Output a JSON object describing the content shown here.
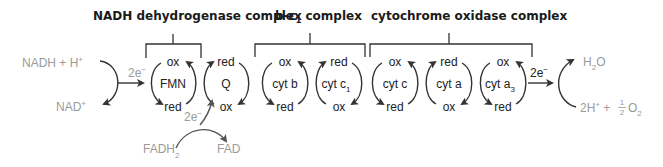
{
  "colors": {
    "primary_text": "#222222",
    "secondary_text": "#9a9a9a",
    "header_text": "#1a1a1a",
    "stroke": "#333333"
  },
  "complexes": [
    {
      "name": "NADH dehydrogenase complex",
      "main": "NADH dehydrogenase complex"
    },
    {
      "name": "b-c1 complex",
      "main": "b-c",
      "sub": "1",
      "rest": " complex"
    },
    {
      "name": "cytochrome oxidase complex",
      "main": "cytochrome oxidase complex"
    }
  ],
  "carriers": [
    {
      "name": "FMN",
      "main": "FMN",
      "sub": "",
      "top": "ox",
      "bottom": "red"
    },
    {
      "name": "Q",
      "main": "Q",
      "sub": "",
      "top": "red",
      "bottom": "ox"
    },
    {
      "name": "cyt b",
      "main": "cyt b",
      "sub": "",
      "top": "ox",
      "bottom": "red"
    },
    {
      "name": "cyt c1",
      "main": "cyt c",
      "sub": "1",
      "top": "red",
      "bottom": "ox"
    },
    {
      "name": "cyt c",
      "main": "cyt c",
      "sub": "",
      "top": "ox",
      "bottom": "red"
    },
    {
      "name": "cyt a",
      "main": "cyt a",
      "sub": "",
      "top": "red",
      "bottom": "ox"
    },
    {
      "name": "cyt a3",
      "main": "cyt a",
      "sub": "3",
      "top": "ox",
      "bottom": "red"
    }
  ],
  "inputs": {
    "nadh": {
      "main": "NADH + H",
      "sup": "+"
    },
    "nad": {
      "main": "NAD",
      "sup": "+"
    },
    "fadh2": {
      "main": "FADH",
      "sub": "2"
    },
    "fad": {
      "main": "FAD"
    },
    "electrons_in": {
      "main": "2e",
      "sup": "−"
    },
    "electrons_fad": {
      "main": "2e",
      "sup": "−"
    },
    "electrons_out": {
      "main": "2e",
      "sup": "−"
    }
  },
  "outputs": {
    "water": {
      "pre": "H",
      "sub": "2",
      "post": "O"
    },
    "oxygen": {
      "pre": "2H",
      "sup": "+",
      "mid": " + ",
      "frac_num": "1",
      "frac_den": "2",
      "post": "O",
      "sub": "2"
    }
  }
}
